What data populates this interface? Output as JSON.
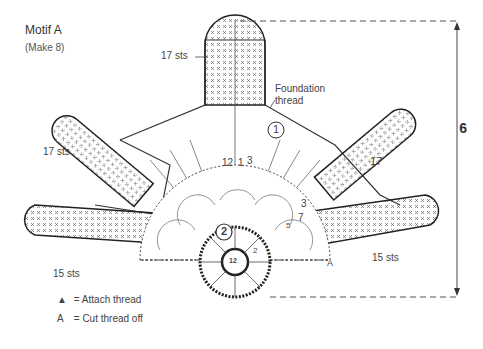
{
  "title": "Motif A",
  "subtitle": "(Make 8)",
  "dimension": "6",
  "labels": {
    "top_arm": "17 sts",
    "upper_left_arm": "17 sts",
    "upper_right_arm": "17",
    "lower_left_arm": "15 sts",
    "lower_right_arm": "15 sts",
    "foundation": "Foundation\nthread",
    "foundation_line1": "Foundation",
    "foundation_line2": "thread",
    "round_1": "1",
    "round_2": "2",
    "center": "12",
    "row_12": "12",
    "row_1": "1",
    "row_3": "3",
    "fan_3": "3",
    "fan_5": "5",
    "fan_7": "7",
    "fan_2": "2",
    "attach_mark": "A"
  },
  "legend": [
    {
      "symbol": "▲",
      "text": "= Attach thread"
    },
    {
      "symbol": "A",
      "text": "= Cut thread off"
    }
  ]
}
